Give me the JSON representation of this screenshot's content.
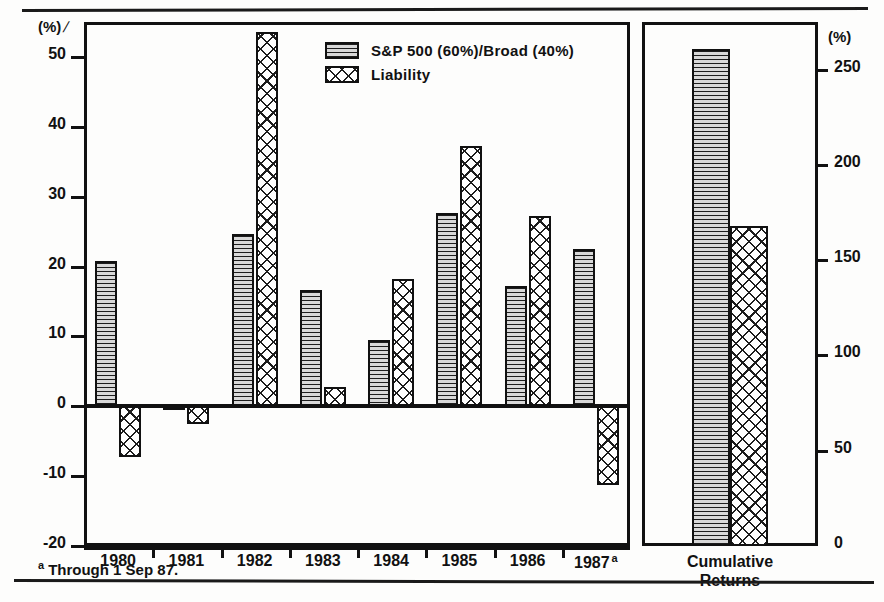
{
  "figure": {
    "clipped_title": "",
    "units_left": "(%)",
    "units_right": "(%)",
    "footnote_marker": "a",
    "footnote_text": "Through 1 Sep 87."
  },
  "legend": {
    "items": [
      {
        "label": "S&P 500 (60%)/Broad (40%)",
        "pattern": "horizontal-lines",
        "key": "sp500"
      },
      {
        "label": "Liability",
        "pattern": "cross-hatch",
        "key": "liability"
      }
    ]
  },
  "cumulative_panel": {
    "caption_line1": "Cumulative",
    "caption_line2": "Returns"
  },
  "chart_data": {
    "type": "bar",
    "title": "",
    "subtitle": "",
    "xlabel": "",
    "ylabel": "(%)",
    "ylabel_right": "(%)",
    "grid": false,
    "legend_position": "top-center",
    "categories": [
      "1980",
      "1981",
      "1982",
      "1983",
      "1984",
      "1985",
      "1986",
      "1987"
    ],
    "category_labels": [
      "1980",
      "1981",
      "1982",
      "1983",
      "1984",
      "1985",
      "1986",
      "1987 a"
    ],
    "series": [
      {
        "name": "S&P 500 (60%)/Broad (40%)",
        "values": [
          20.8,
          -0.4,
          24.7,
          16.7,
          9.5,
          27.7,
          17.2,
          22.5
        ]
      },
      {
        "name": "Liability",
        "values": [
          -7.3,
          -2.5,
          53.5,
          2.7,
          18.2,
          37.2,
          27.2,
          -11.3
        ]
      }
    ],
    "ylim": [
      -20,
      55
    ],
    "yticks": [
      -20,
      -10,
      0,
      10,
      20,
      30,
      40,
      50
    ],
    "ytick_labels": [
      "-20",
      "-10",
      "0",
      "10",
      "20",
      "30",
      "40",
      "50"
    ],
    "secondary_axis": {
      "ylim": [
        0,
        275
      ],
      "yticks": [
        0,
        50,
        100,
        150,
        200,
        250
      ],
      "ytick_labels": [
        "0",
        "50",
        "100",
        "150",
        "200",
        "250"
      ]
    },
    "cumulative": {
      "category": "Cumulative Returns",
      "axis": "secondary",
      "series": [
        {
          "name": "S&P 500 (60%)/Broad (40%)",
          "value": 261
        },
        {
          "name": "Liability",
          "value": 168
        }
      ]
    },
    "annotations": [
      "a Through 1 Sep 87."
    ]
  }
}
